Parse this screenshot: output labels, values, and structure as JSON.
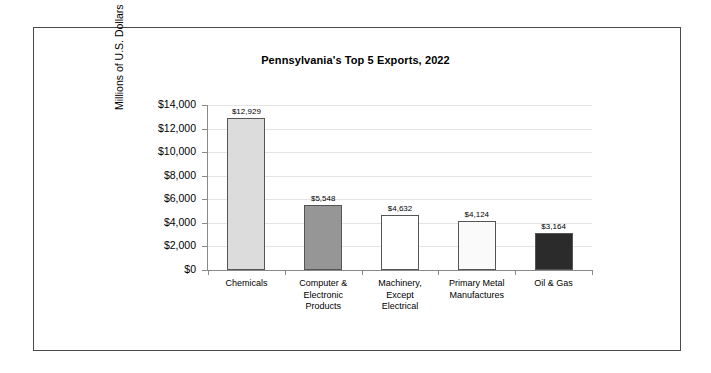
{
  "chart_data": {
    "type": "bar",
    "title": "Pennsylvania's Top 5 Exports, 2022",
    "xlabel": "",
    "ylabel": "Millions of U.S. Dollars",
    "ylim": [
      0,
      14000
    ],
    "ytick_step": 2000,
    "grid": true,
    "legend": "none",
    "categories": [
      "Chemicals",
      "Computer & Electronic Products",
      "Machinery, Except Electrical",
      "Primary Metal Manufactures",
      "Oil & Gas"
    ],
    "category_lines": [
      [
        "Chemicals"
      ],
      [
        "Computer &",
        "Electronic",
        "Products"
      ],
      [
        "Machinery,",
        "Except",
        "Electrical"
      ],
      [
        "Primary Metal",
        "Manufactures"
      ],
      [
        "Oil & Gas"
      ]
    ],
    "values": [
      12929,
      5548,
      4632,
      4124,
      3164
    ],
    "value_labels": [
      "$12,929",
      "$5,548",
      "$4,632",
      "$4,124",
      "$3,164"
    ],
    "ytick_labels": [
      "$14,000",
      "$12,000",
      "$10,000",
      "$8,000",
      "$6,000",
      "$4,000",
      "$2,000",
      "$0"
    ],
    "ytick_values": [
      14000,
      12000,
      10000,
      8000,
      6000,
      4000,
      2000,
      0
    ],
    "bar_colors": [
      "#dcdcdc",
      "#969696",
      "#ffffff",
      "#fafafa",
      "#2b2b2b"
    ],
    "bar_border_color": "#555555",
    "gridline_color": "#e4e4e4",
    "axis_color": "#8a8a8a",
    "frame_color": "#4a4a4a",
    "background_color": "#ffffff"
  }
}
